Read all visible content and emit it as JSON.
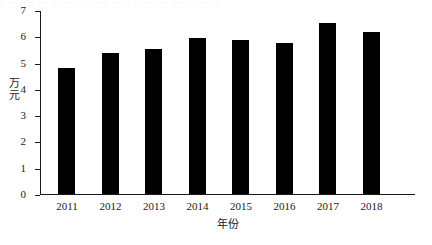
{
  "chart_data": {
    "type": "bar",
    "title": "",
    "subtitle": "",
    "xlabel": "年份",
    "ylabel": "万元",
    "categories": [
      "2011",
      "2012",
      "2013",
      "2014",
      "2015",
      "2016",
      "2017",
      "2018"
    ],
    "values": [
      4.8,
      5.35,
      5.5,
      5.95,
      5.85,
      5.75,
      6.5,
      6.15
    ],
    "series": [
      {
        "name": "",
        "values": [
          4.8,
          5.35,
          5.5,
          5.95,
          5.85,
          5.75,
          6.5,
          6.15
        ]
      }
    ],
    "ylim": [
      0,
      7
    ],
    "yticks": [
      "0",
      "1",
      "2",
      "3",
      "4",
      "5",
      "6",
      "7"
    ],
    "ytick_values": [
      0,
      1,
      2,
      3,
      4,
      5,
      6,
      7
    ],
    "grid": false,
    "legend": false,
    "legend_position": "none",
    "bar_color": "#000000",
    "axis_color": "#1a1a1a",
    "background_color": "#ffffff",
    "annotations": []
  },
  "artifacts": {
    "top_sliver_text": "· ·· ·· · ··· ·· ·· ·· · ··· ·· ·· ·· ··· ·· ··· ·· ·· ··"
  }
}
